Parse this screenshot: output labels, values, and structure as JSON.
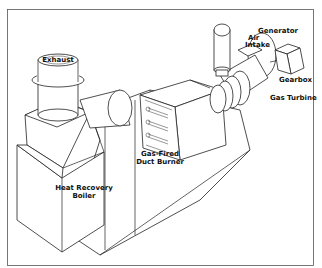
{
  "diagram": {
    "labels": {
      "exhaust": "Exhaust",
      "air_intake_line1": "Air",
      "air_intake_line2": "Intake",
      "generator": "Generator",
      "gearbox": "Gearbox",
      "gas_turbine": "Gas Turbine",
      "duct_burner_line1": "Gas-Fired",
      "duct_burner_line2": "Duct Burner",
      "boiler_line1": "Heat Recovery",
      "boiler_line2": "Boiler"
    },
    "components": [
      "Exhaust stack",
      "Heat recovery boiler",
      "Transition duct",
      "Gas-fired duct burner",
      "Gas turbine",
      "Air intake",
      "Gearbox",
      "Generator"
    ],
    "colors": {
      "line": "#222222",
      "background": "#ffffff",
      "frame": "#555555"
    }
  }
}
